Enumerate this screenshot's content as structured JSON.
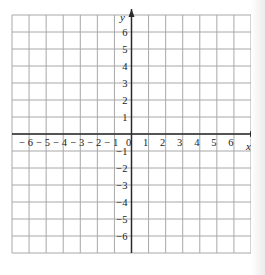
{
  "chart_data": {
    "type": "coordinate-grid",
    "title": "",
    "xlabel": "x",
    "ylabel": "y",
    "xlim": [
      -7,
      7
    ],
    "ylim": [
      -7,
      7
    ],
    "grid": true,
    "grid_step": 1,
    "x_tick_labels": [
      "-6",
      "-5",
      "-4",
      "-3",
      "-2",
      "-1",
      "0",
      "1",
      "2",
      "3",
      "4",
      "5",
      "6"
    ],
    "y_tick_labels": [
      "6",
      "5",
      "4",
      "3",
      "2",
      "1",
      "-1",
      "-2",
      "-3",
      "-4",
      "-5",
      "-6"
    ],
    "x_ticks": [
      -6,
      -5,
      -4,
      -3,
      -2,
      -1,
      0,
      1,
      2,
      3,
      4,
      5,
      6
    ],
    "y_ticks": [
      6,
      5,
      4,
      3,
      2,
      1,
      -1,
      -2,
      -3,
      -4,
      -5,
      -6
    ],
    "series": []
  },
  "colors": {
    "grid": "#a8a8a8",
    "axis": "#2a2a2a",
    "text": "#222222"
  },
  "labels": {
    "x_axis": "x",
    "y_axis": "y",
    "origin": "0"
  }
}
